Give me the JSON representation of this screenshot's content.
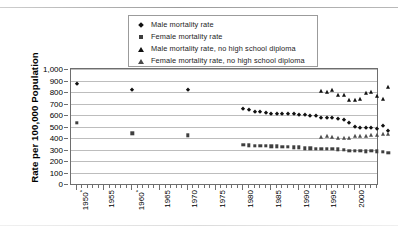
{
  "chart_data": {
    "type": "scatter",
    "title": "",
    "xlabel": "",
    "ylabel": "Rate per 100,000 Population",
    "xlim": [
      1949,
      2004
    ],
    "ylim": [
      0,
      1000
    ],
    "ytick_labels": [
      "1,000",
      "900",
      "800",
      "700",
      "600",
      "500",
      "400",
      "300",
      "200",
      "100",
      "0"
    ],
    "ytick_values": [
      1000,
      900,
      800,
      700,
      600,
      500,
      400,
      300,
      200,
      100,
      0
    ],
    "xtick_labels": [
      "1950*",
      "1955",
      "1960*",
      "1965",
      "1970",
      "1975",
      "1980",
      "1985",
      "1990",
      "1995",
      "2000"
    ],
    "xtick_values": [
      1950,
      1955,
      1960,
      1965,
      1970,
      1975,
      1980,
      1985,
      1990,
      1995,
      2000
    ],
    "grid": "horizontal",
    "legend_position": "top-center",
    "series": [
      {
        "name": "Male mortality rate",
        "marker": "diamond",
        "color": "#111111",
        "points": [
          [
            1950,
            870
          ],
          [
            1960,
            815
          ],
          [
            1970,
            820
          ],
          [
            1980,
            655
          ],
          [
            1981,
            640
          ],
          [
            1982,
            625
          ],
          [
            1983,
            622
          ],
          [
            1984,
            618
          ],
          [
            1985,
            612
          ],
          [
            1986,
            608
          ],
          [
            1987,
            610
          ],
          [
            1988,
            608
          ],
          [
            1989,
            605
          ],
          [
            1990,
            600
          ],
          [
            1991,
            598
          ],
          [
            1992,
            592
          ],
          [
            1993,
            590
          ],
          [
            1994,
            578
          ],
          [
            1995,
            572
          ],
          [
            1996,
            570
          ],
          [
            1997,
            568
          ],
          [
            1998,
            560
          ],
          [
            1999,
            530
          ],
          [
            2000,
            495
          ],
          [
            2001,
            488
          ],
          [
            2002,
            487
          ],
          [
            2003,
            485
          ],
          [
            2004,
            482
          ],
          [
            2005,
            505
          ],
          [
            2006,
            458
          ]
        ]
      },
      {
        "name": "Female mortality rate",
        "marker": "square",
        "color": "#3f3f3f",
        "points": [
          [
            1950,
            530
          ],
          [
            1960,
            440
          ],
          [
            1970,
            422
          ],
          [
            1980,
            340
          ],
          [
            1981,
            335
          ],
          [
            1982,
            333
          ],
          [
            1983,
            332
          ],
          [
            1984,
            330
          ],
          [
            1985,
            328
          ],
          [
            1986,
            327
          ],
          [
            1987,
            326
          ],
          [
            1988,
            324
          ],
          [
            1989,
            320
          ],
          [
            1990,
            318
          ],
          [
            1991,
            312
          ],
          [
            1992,
            310
          ],
          [
            1993,
            308
          ],
          [
            1994,
            305
          ],
          [
            1995,
            308
          ],
          [
            1996,
            305
          ],
          [
            1997,
            302
          ],
          [
            1998,
            300
          ],
          [
            1999,
            290
          ],
          [
            2000,
            288
          ],
          [
            2001,
            287
          ],
          [
            2002,
            285
          ],
          [
            2003,
            288
          ],
          [
            2004,
            284
          ],
          [
            2005,
            280
          ],
          [
            2006,
            272
          ]
        ]
      },
      {
        "name": "Male mortality rate, no high school diploma",
        "marker": "triangle",
        "color": "#111111",
        "points": [
          [
            1994,
            805
          ],
          [
            1995,
            802
          ],
          [
            1996,
            818
          ],
          [
            1997,
            778
          ],
          [
            1998,
            772
          ],
          [
            1999,
            728
          ],
          [
            2000,
            730
          ],
          [
            2001,
            742
          ],
          [
            2002,
            790
          ],
          [
            2003,
            798
          ],
          [
            2004,
            768
          ],
          [
            2005,
            742
          ],
          [
            2006,
            840
          ]
        ]
      },
      {
        "name": "Female mortality rate, no high school diploma",
        "marker": "triangle-light",
        "color": "#4d4d4d",
        "points": [
          [
            1994,
            412
          ],
          [
            1995,
            420
          ],
          [
            1996,
            408
          ],
          [
            1997,
            402
          ],
          [
            1998,
            400
          ],
          [
            1999,
            400
          ],
          [
            2000,
            415
          ],
          [
            2001,
            418
          ],
          [
            2002,
            420
          ],
          [
            2003,
            422
          ],
          [
            2004,
            425
          ],
          [
            2005,
            432
          ],
          [
            2006,
            438
          ]
        ]
      }
    ],
    "legend": [
      {
        "label": "Male mortality rate",
        "marker": "diamond"
      },
      {
        "label": "Female mortality rate",
        "marker": "square"
      },
      {
        "label": "Male mortality rate, no high school diploma",
        "marker": "triangle"
      },
      {
        "label": "Female mortality rate, no high school diploma",
        "marker": "triangle-light"
      }
    ]
  }
}
